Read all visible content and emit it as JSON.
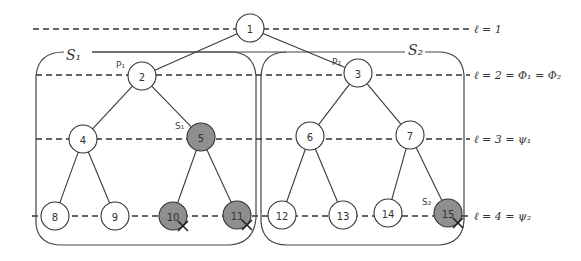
{
  "diagram": {
    "colors": {
      "line": "#333333",
      "node_fill": "#ffffff",
      "node_highlight_fill": "#8f8f8f",
      "background": "#ffffff"
    },
    "levels": [
      {
        "y": 29,
        "label": "ℓ = 1"
      },
      {
        "y": 75,
        "label": "ℓ = 2 = Φ₁ = Φ₂"
      },
      {
        "y": 139,
        "label": "ℓ = 3 = ψ₁"
      },
      {
        "y": 216,
        "label": "ℓ = 4 = ψ₂"
      }
    ],
    "sets": [
      {
        "id": "S1",
        "label": "S₁",
        "box": {
          "x": 36,
          "y": 52,
          "w": 220,
          "h": 193
        }
      },
      {
        "id": "S2",
        "label": "S₂",
        "box": {
          "x": 261,
          "y": 52,
          "w": 203,
          "h": 193
        }
      }
    ],
    "nodes": [
      {
        "id": "1",
        "label": "1",
        "x": 250,
        "y": 28,
        "shaded": false
      },
      {
        "id": "2",
        "label": "2",
        "x": 142,
        "y": 76,
        "shaded": false,
        "tag": "P₁"
      },
      {
        "id": "3",
        "label": "3",
        "x": 358,
        "y": 73,
        "shaded": false,
        "tag": "P₂"
      },
      {
        "id": "4",
        "label": "4",
        "x": 83,
        "y": 139,
        "shaded": false
      },
      {
        "id": "5",
        "label": "5",
        "x": 201,
        "y": 137,
        "shaded": true,
        "tag": "S₁"
      },
      {
        "id": "6",
        "label": "6",
        "x": 310,
        "y": 136,
        "shaded": false
      },
      {
        "id": "7",
        "label": "7",
        "x": 410,
        "y": 135,
        "shaded": false
      },
      {
        "id": "8",
        "label": "8",
        "x": 55,
        "y": 216,
        "shaded": false
      },
      {
        "id": "9",
        "label": "9",
        "x": 115,
        "y": 216,
        "shaded": false
      },
      {
        "id": "10",
        "label": "10",
        "x": 173,
        "y": 216,
        "shaded": true,
        "crossed": true
      },
      {
        "id": "11",
        "label": "11",
        "x": 237,
        "y": 215,
        "shaded": true,
        "crossed": true
      },
      {
        "id": "12",
        "label": "12",
        "x": 282,
        "y": 215,
        "shaded": false
      },
      {
        "id": "13",
        "label": "13",
        "x": 343,
        "y": 215,
        "shaded": false
      },
      {
        "id": "14",
        "label": "14",
        "x": 388,
        "y": 213,
        "shaded": false
      },
      {
        "id": "15",
        "label": "15",
        "x": 448,
        "y": 213,
        "shaded": true,
        "crossed": true,
        "tag": "S₂"
      }
    ],
    "edges": [
      [
        "1",
        "2"
      ],
      [
        "1",
        "3"
      ],
      [
        "2",
        "4"
      ],
      [
        "2",
        "5"
      ],
      [
        "3",
        "6"
      ],
      [
        "3",
        "7"
      ],
      [
        "4",
        "8"
      ],
      [
        "4",
        "9"
      ],
      [
        "5",
        "10"
      ],
      [
        "5",
        "11"
      ],
      [
        "6",
        "12"
      ],
      [
        "6",
        "13"
      ],
      [
        "7",
        "14"
      ],
      [
        "7",
        "15"
      ]
    ]
  }
}
